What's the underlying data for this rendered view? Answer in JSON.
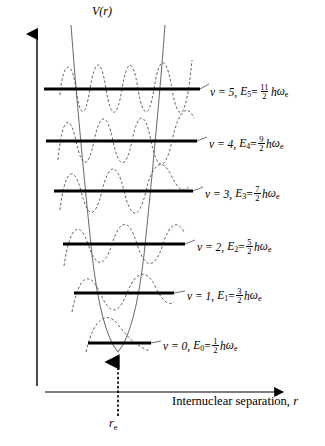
{
  "figure": {
    "type": "harmonic-oscillator-potential-diagram",
    "axes": {
      "y_label": "V(r)",
      "x_label_text": "Internuclear separation, ",
      "x_label_symbol": "r",
      "equilibrium_label": "r",
      "equilibrium_subscript": "e"
    },
    "colors": {
      "ink": "#000000",
      "background": "#ffffff",
      "level_line": "#000000",
      "wavefunction": "#555555",
      "potential_curve": "#777777"
    },
    "levels": [
      {
        "v_text": "v = 5,",
        "e_symbol": "E",
        "e_subscript": "5",
        "equals": "=",
        "numerator": "11",
        "denominator": "2",
        "hbar": "h",
        "omega": "ω",
        "omega_subscript": "e",
        "quantum_number": 5,
        "energy_coefficient": "11/2",
        "line_y": 89,
        "line_x1": 44,
        "line_x2": 200,
        "label_x": 210,
        "label_y": 83
      },
      {
        "v_text": "v = 4,",
        "e_symbol": "E",
        "e_subscript": "4",
        "equals": "=",
        "numerator": "9",
        "denominator": "2",
        "hbar": "h",
        "omega": "ω",
        "omega_subscript": "e",
        "quantum_number": 4,
        "energy_coefficient": "9/2",
        "line_y": 141,
        "line_x1": 46,
        "line_x2": 197,
        "label_x": 209,
        "label_y": 135
      },
      {
        "v_text": "v = 3,",
        "e_symbol": "E",
        "e_subscript": "3",
        "equals": "=",
        "numerator": "7",
        "denominator": "2",
        "hbar": "h",
        "omega": "ω",
        "omega_subscript": "e",
        "quantum_number": 3,
        "energy_coefficient": "7/2",
        "line_y": 191,
        "line_x1": 54,
        "line_x2": 193,
        "label_x": 205,
        "label_y": 185
      },
      {
        "v_text": "v = 2,",
        "e_symbol": "E",
        "e_subscript": "2",
        "equals": "=",
        "numerator": "5",
        "denominator": "2",
        "hbar": "h",
        "omega": "ω",
        "omega_subscript": "e",
        "quantum_number": 2,
        "energy_coefficient": "5/2",
        "line_y": 244,
        "line_x1": 63,
        "line_x2": 185,
        "label_x": 197,
        "label_y": 238
      },
      {
        "v_text": "v = 1,",
        "e_symbol": "E",
        "e_subscript": "1",
        "equals": "=",
        "numerator": "3",
        "denominator": "2",
        "hbar": "h",
        "omega": "ω",
        "omega_subscript": "e",
        "quantum_number": 1,
        "energy_coefficient": "3/2",
        "line_y": 293,
        "line_x1": 74,
        "line_x2": 174,
        "label_x": 187,
        "label_y": 287
      },
      {
        "v_text": "v = 0,",
        "e_symbol": "E",
        "e_subscript": "0",
        "equals": "=",
        "numerator": "1",
        "denominator": "2",
        "hbar": "h",
        "omega": "ω",
        "omega_subscript": "e",
        "quantum_number": 0,
        "energy_coefficient": "1/2",
        "line_y": 343,
        "line_x1": 88,
        "line_x2": 151,
        "label_x": 163,
        "label_y": 337
      }
    ]
  },
  "chart_data": {
    "type": "line",
    "title": "",
    "xlabel": "Internuclear separation, r",
    "ylabel": "V(r)",
    "grid": false,
    "legend": "none",
    "potential": {
      "form": "harmonic (parabolic)",
      "vertex_x_label": "r_e",
      "vertex_pixel": [
        118,
        352
      ],
      "top_pixel_y": 25
    },
    "categories": [
      "v = 0",
      "v = 1",
      "v = 2",
      "v = 3",
      "v = 4",
      "v = 5"
    ],
    "values": [
      0.5,
      1.5,
      2.5,
      3.5,
      4.5,
      5.5
    ],
    "value_units": "hωe",
    "series": [
      {
        "name": "Vibrational energy levels",
        "values": [
          0.5,
          1.5,
          2.5,
          3.5,
          4.5,
          5.5
        ]
      }
    ],
    "annotations": [
      "v = 0, E0 = 1/2 hωe",
      "v = 1, E1 = 3/2 hωe",
      "v = 2, E2 = 5/2 hωe",
      "v = 3, E3 = 7/2 hωe",
      "v = 4, E4 = 9/2 hωe",
      "v = 5, E5 = 11/2 hωe",
      "r_e"
    ]
  }
}
